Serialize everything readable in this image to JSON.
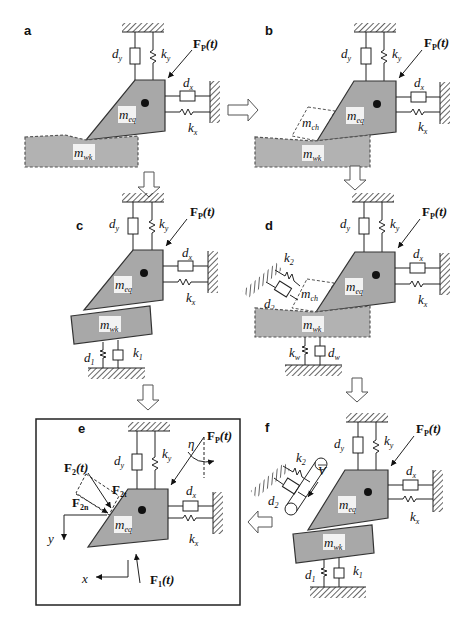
{
  "panels": {
    "a": {
      "label": "a",
      "force": "F",
      "force_sub": "P",
      "force_arg": "(t)",
      "dy": "d",
      "dy_sub": "y",
      "ky": "k",
      "ky_sub": "y",
      "dx": "d",
      "dx_sub": "x",
      "kx": "k",
      "kx_sub": "x",
      "m_eq": "m",
      "m_eq_sub": "eq",
      "m_wk": "m",
      "m_wk_sub": "wk"
    },
    "b": {
      "label": "b",
      "force": "F",
      "force_sub": "P",
      "force_arg": "(t)",
      "dy": "d",
      "dy_sub": "y",
      "ky": "k",
      "ky_sub": "y",
      "dx": "d",
      "dx_sub": "x",
      "kx": "k",
      "kx_sub": "x",
      "m_eq": "m",
      "m_eq_sub": "eq",
      "m_ch": "m",
      "m_ch_sub": "ch",
      "m_wk": "m",
      "m_wk_sub": "wk"
    },
    "c": {
      "label": "c",
      "force": "F",
      "force_sub": "P",
      "force_arg": "(t)",
      "dy": "d",
      "dy_sub": "y",
      "ky": "k",
      "ky_sub": "y",
      "dx": "d",
      "dx_sub": "x",
      "kx": "k",
      "kx_sub": "x",
      "m_eq": "m",
      "m_eq_sub": "eq",
      "m_wk": "m",
      "m_wk_sub": "wk",
      "d1": "d",
      "d1_sub": "1",
      "k1": "k",
      "k1_sub": "1"
    },
    "d": {
      "label": "d",
      "force": "F",
      "force_sub": "P",
      "force_arg": "(t)",
      "dy": "d",
      "dy_sub": "y",
      "ky": "k",
      "ky_sub": "y",
      "dx": "d",
      "dx_sub": "x",
      "kx": "k",
      "kx_sub": "x",
      "m_eq": "m",
      "m_eq_sub": "eq",
      "m_ch": "m",
      "m_ch_sub": "ch",
      "m_wk": "m",
      "m_wk_sub": "wk",
      "k2": "k",
      "k2_sub": "2",
      "d2": "d",
      "d2_sub": "2",
      "kw": "k",
      "kw_sub": "w",
      "dw": "d",
      "dw_sub": "w"
    },
    "e": {
      "label": "e",
      "force": "F",
      "force_sub": "P",
      "force_arg": "(t)",
      "eta": "η",
      "dy": "d",
      "dy_sub": "y",
      "ky": "k",
      "ky_sub": "y",
      "dx": "d",
      "dx_sub": "x",
      "kx": "k",
      "kx_sub": "x",
      "m_eq": "m",
      "m_eq_sub": "eq",
      "f2": "F",
      "f2_sub": "2",
      "f2_arg": "(t)",
      "f2t": "F",
      "f2t_sub": "2t",
      "f2n": "F",
      "f2n_sub": "2n",
      "f1": "F",
      "f1_sub": "1",
      "f1_arg": "(t)",
      "axis_x": "x",
      "axis_y": "y"
    },
    "f": {
      "label": "f",
      "force": "F",
      "force_sub": "P",
      "force_arg": "(t)",
      "dy": "d",
      "dy_sub": "y",
      "ky": "k",
      "ky_sub": "y",
      "dx": "d",
      "dx_sub": "x",
      "kx": "k",
      "kx_sub": "x",
      "m_eq": "m",
      "m_eq_sub": "eq",
      "m_wk": "m",
      "m_wk_sub": "wk",
      "k2": "k",
      "k2_sub": "2",
      "d2": "d",
      "d2_sub": "2",
      "v": "V",
      "d1": "d",
      "d1_sub": "1",
      "k1": "k",
      "k1_sub": "1"
    }
  },
  "colors": {
    "body": "#a8a8a8",
    "workpiece": "#b2b2b2",
    "line": "#222222"
  }
}
